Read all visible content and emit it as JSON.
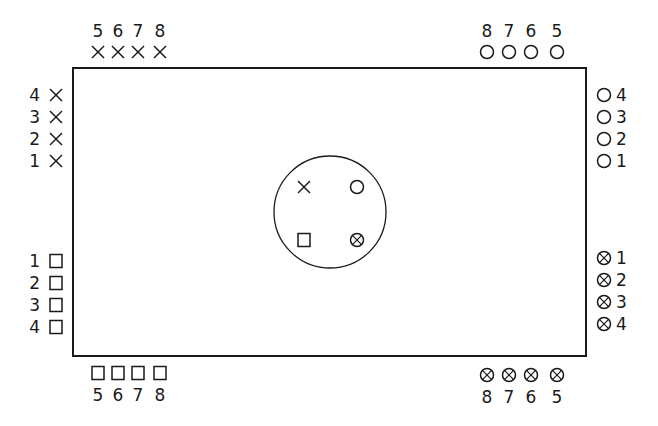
{
  "diagram": {
    "colors": {
      "stroke": "#1a1a1a",
      "background": "#ffffff"
    },
    "board": {
      "x": 73,
      "y": 68,
      "width": 513,
      "height": 288
    },
    "center_circle": {
      "cx": 330,
      "cy": 212,
      "r": 56,
      "markers": [
        {
          "symbol": "x",
          "x": 304,
          "y": 187
        },
        {
          "symbol": "circle",
          "x": 357,
          "y": 187
        },
        {
          "symbol": "square",
          "x": 304,
          "y": 240
        },
        {
          "symbol": "circle-x",
          "x": 357,
          "y": 240
        }
      ]
    },
    "groups": {
      "top_left": {
        "symbol": "x",
        "labels": [
          "5",
          "6",
          "7",
          "8"
        ]
      },
      "left_upper": {
        "symbol": "x",
        "labels": [
          "4",
          "3",
          "2",
          "1"
        ]
      },
      "left_lower": {
        "symbol": "square",
        "labels": [
          "1",
          "2",
          "3",
          "4"
        ]
      },
      "bottom_left": {
        "symbol": "square",
        "labels": [
          "5",
          "6",
          "7",
          "8"
        ]
      },
      "top_right": {
        "symbol": "circle",
        "labels": [
          "8",
          "7",
          "6",
          "5"
        ]
      },
      "right_upper": {
        "symbol": "circle",
        "labels": [
          "4",
          "3",
          "2",
          "1"
        ]
      },
      "right_lower": {
        "symbol": "circle-x",
        "labels": [
          "1",
          "2",
          "3",
          "4"
        ]
      },
      "bottom_right": {
        "symbol": "circle-x",
        "labels": [
          "8",
          "7",
          "6",
          "5"
        ]
      }
    }
  }
}
